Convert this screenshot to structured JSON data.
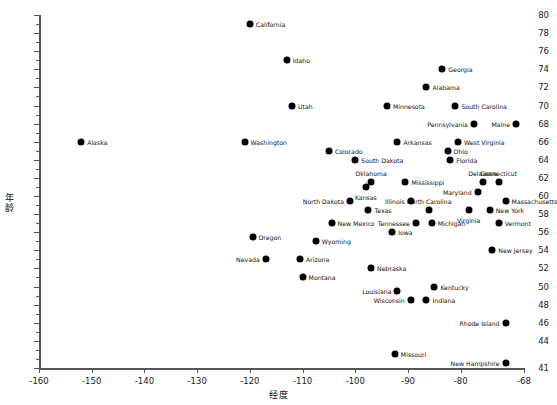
{
  "chart_data": {
    "type": "scatter",
    "title": "",
    "xlabel": "经度",
    "ylabel": "年龄",
    "xlim": [
      -160,
      -68
    ],
    "ylim": [
      41,
      80
    ],
    "xticks": [
      -160,
      -150,
      -140,
      -130,
      -120,
      -110,
      -100,
      -90,
      -80,
      -68
    ],
    "xticklabels": [
      "-160",
      "-150",
      "-140",
      "-130",
      "-120",
      "-110",
      "-100",
      "-90",
      "-80",
      "-68"
    ],
    "yticks": [
      41,
      44,
      46,
      48,
      50,
      52,
      54,
      56,
      58,
      60,
      62,
      64,
      66,
      68,
      70,
      72,
      74,
      76,
      78,
      80
    ],
    "yticklabels": [
      "41",
      "44",
      "46",
      "48",
      "50",
      "52",
      "54",
      "56",
      "58",
      "60",
      "62",
      "64",
      "66",
      "68",
      "70",
      "72",
      "74",
      "76",
      "78",
      "80"
    ],
    "grid": false,
    "legend": null,
    "marker_color": "#000000",
    "points": [
      {
        "label": "California",
        "x": -120.0,
        "y": 79.0,
        "lp": "right"
      },
      {
        "label": "Idaho",
        "x": -113.0,
        "y": 75.0,
        "lp": "right"
      },
      {
        "label": "Utah",
        "x": -112.0,
        "y": 70.0,
        "lp": "right"
      },
      {
        "label": "Georgia",
        "x": -83.5,
        "y": 74.0,
        "lp": "right"
      },
      {
        "label": "Alabama",
        "x": -86.5,
        "y": 72.0,
        "lp": "right"
      },
      {
        "label": "Minnesota",
        "x": -94.0,
        "y": 70.0,
        "lp": "right"
      },
      {
        "label": "South Carolina",
        "x": -81.0,
        "y": 70.0,
        "lp": "right"
      },
      {
        "label": "Pennsylvania",
        "x": -77.5,
        "y": 68.0,
        "lp": "left"
      },
      {
        "label": "Maine",
        "x": -69.5,
        "y": 68.0,
        "lp": "left"
      },
      {
        "label": "Alaska",
        "x": -152.0,
        "y": 66.0,
        "lp": "right"
      },
      {
        "label": "Washington",
        "x": -121.0,
        "y": 66.0,
        "lp": "right"
      },
      {
        "label": "Arkansas",
        "x": -92.0,
        "y": 66.0,
        "lp": "right"
      },
      {
        "label": "West Virginia",
        "x": -80.5,
        "y": 66.0,
        "lp": "right"
      },
      {
        "label": "Ohio",
        "x": -82.5,
        "y": 65.0,
        "lp": "right"
      },
      {
        "label": "Colorado",
        "x": -105.0,
        "y": 65.0,
        "lp": "right"
      },
      {
        "label": "Florida",
        "x": -82.0,
        "y": 64.0,
        "lp": "right"
      },
      {
        "label": "South Dakota",
        "x": -100.0,
        "y": 64.0,
        "lp": "right"
      },
      {
        "label": "Oklahoma",
        "x": -97.0,
        "y": 61.5,
        "lp": "above"
      },
      {
        "label": "Mississippi",
        "x": -90.5,
        "y": 61.5,
        "lp": "right"
      },
      {
        "label": "Delaware",
        "x": -75.8,
        "y": 61.5,
        "lp": "above"
      },
      {
        "label": "Connecticut",
        "x": -72.8,
        "y": 61.5,
        "lp": "above"
      },
      {
        "label": "Kansas",
        "x": -98.0,
        "y": 61.0,
        "lp": "below"
      },
      {
        "label": "Maryland",
        "x": -76.8,
        "y": 60.5,
        "lp": "left"
      },
      {
        "label": "North Dakota",
        "x": -101.0,
        "y": 59.5,
        "lp": "left"
      },
      {
        "label": "Illinois",
        "x": -89.5,
        "y": 59.5,
        "lp": "left"
      },
      {
        "label": "Massachusetts",
        "x": -71.5,
        "y": 59.5,
        "lp": "right"
      },
      {
        "label": "Virginia",
        "x": -78.5,
        "y": 58.5,
        "lp": "below"
      },
      {
        "label": "Texas",
        "x": -97.5,
        "y": 58.5,
        "lp": "right"
      },
      {
        "label": "North Carolina",
        "x": -86.0,
        "y": 58.5,
        "lp": "above"
      },
      {
        "label": "New York",
        "x": -74.5,
        "y": 58.5,
        "lp": "right"
      },
      {
        "label": "Tennessee",
        "x": -88.5,
        "y": 57.0,
        "lp": "left"
      },
      {
        "label": "Michigan",
        "x": -85.5,
        "y": 57.0,
        "lp": "right"
      },
      {
        "label": "Vermont",
        "x": -72.8,
        "y": 57.0,
        "lp": "right"
      },
      {
        "label": "New Mexico",
        "x": -104.5,
        "y": 57.0,
        "lp": "right"
      },
      {
        "label": "Iowa",
        "x": -93.0,
        "y": 56.0,
        "lp": "right"
      },
      {
        "label": "Oregon",
        "x": -119.5,
        "y": 55.5,
        "lp": "right"
      },
      {
        "label": "Wyoming",
        "x": -107.5,
        "y": 55.0,
        "lp": "right"
      },
      {
        "label": "New Jersey",
        "x": -74.0,
        "y": 54.0,
        "lp": "right"
      },
      {
        "label": "Nevada",
        "x": -117.0,
        "y": 53.0,
        "lp": "left"
      },
      {
        "label": "Arizona",
        "x": -110.5,
        "y": 53.0,
        "lp": "right"
      },
      {
        "label": "Montana",
        "x": -110.0,
        "y": 51.0,
        "lp": "right"
      },
      {
        "label": "Nebraska",
        "x": -97.0,
        "y": 52.0,
        "lp": "right"
      },
      {
        "label": "Kentucky",
        "x": -85.0,
        "y": 50.0,
        "lp": "right"
      },
      {
        "label": "Louisiana",
        "x": -92.0,
        "y": 49.5,
        "lp": "left"
      },
      {
        "label": "Wisconsin",
        "x": -89.5,
        "y": 48.5,
        "lp": "left"
      },
      {
        "label": "Indiana",
        "x": -86.5,
        "y": 48.5,
        "lp": "right"
      },
      {
        "label": "Rhode Island",
        "x": -71.5,
        "y": 46.0,
        "lp": "left"
      },
      {
        "label": "Missouri",
        "x": -92.5,
        "y": 42.5,
        "lp": "right"
      },
      {
        "label": "New Hampshire",
        "x": -71.5,
        "y": 41.5,
        "lp": "left"
      }
    ]
  }
}
